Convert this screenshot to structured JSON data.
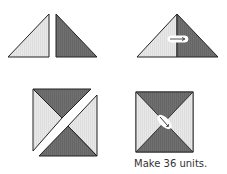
{
  "diagram": {
    "type": "quilt-block-assembly",
    "steps": [
      {
        "id": "step-1",
        "description": "Two half-square triangles, light and dark, placed side by side"
      },
      {
        "id": "step-2",
        "description": "Triangles sewn together into a larger triangle, seam pressed toward dark"
      },
      {
        "id": "step-3",
        "description": "Two pieced triangles placed to form a square along the diagonal"
      },
      {
        "id": "step-4",
        "description": "Finished hourglass unit with center seam pressed"
      }
    ],
    "caption": "Make 36 units.",
    "colors": {
      "light": "#e6e6e6",
      "dark": "#6e6e6e",
      "outline": "#222222",
      "seam_marker": "#ffffff"
    }
  }
}
